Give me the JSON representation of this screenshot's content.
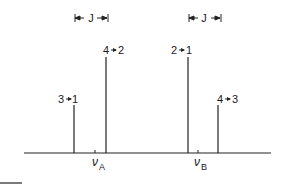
{
  "diagram": {
    "title": "",
    "coupling_marker": {
      "label": "J"
    },
    "axis_labels": {
      "nu_a": {
        "symbol": "ν",
        "subscript": "A"
      },
      "nu_b": {
        "symbol": "ν",
        "subscript": "B"
      }
    },
    "lines": [
      {
        "label": "3→1",
        "from": "3",
        "to": "1",
        "relative_height": 0.45
      },
      {
        "label": "4→2",
        "from": "4",
        "to": "2",
        "relative_height": 0.95
      },
      {
        "label": "2→1",
        "from": "2",
        "to": "1",
        "relative_height": 0.95
      },
      {
        "label": "4→3",
        "from": "4",
        "to": "3",
        "relative_height": 0.45
      }
    ],
    "labels": {
      "l31_a": "3",
      "l31_b": "1",
      "l42_a": "4",
      "l42_b": "2",
      "l21_a": "2",
      "l21_b": "1",
      "l43_a": "4",
      "l43_b": "3"
    }
  }
}
